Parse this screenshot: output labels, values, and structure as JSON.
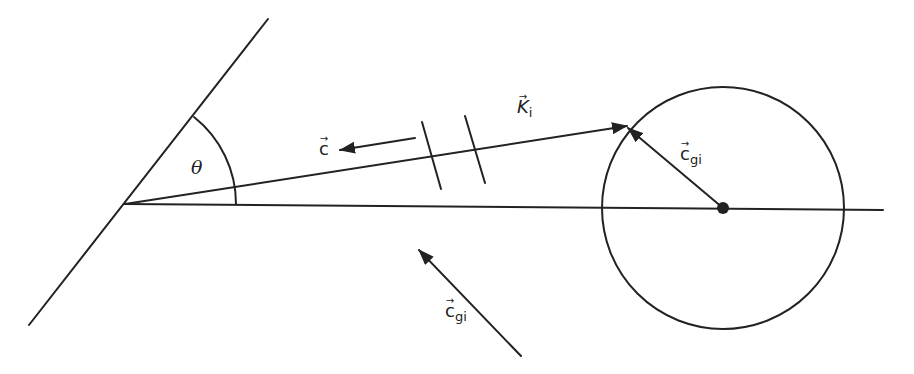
{
  "diagram": {
    "type": "geometric vector diagram",
    "colors": {
      "stroke": "#222222",
      "background": "#ffffff"
    },
    "labels": {
      "theta": "θ",
      "K_i": {
        "base": "K",
        "sub": "i",
        "arrow": "→"
      },
      "c": {
        "base": "c",
        "arrow": "→"
      },
      "c_gi_circle": {
        "base": "c",
        "sub": "gi",
        "arrow": "→"
      },
      "c_gi_lower": {
        "base": "c",
        "sub": "gi",
        "arrow": "→"
      }
    },
    "elements": {
      "wall_line": {
        "x1": 268,
        "y1": 19,
        "x2": 29,
        "y2": 325
      },
      "vertex": {
        "x": 125,
        "y": 204
      },
      "baseline": {
        "x1": 125,
        "y1": 204,
        "x2": 883,
        "y2": 210
      },
      "k_vector": {
        "x1": 125,
        "y1": 204,
        "x2": 627,
        "y2": 126
      },
      "angle_arc": {
        "cx": 125,
        "cy": 204,
        "r": 111
      },
      "circle": {
        "cx": 723,
        "cy": 208,
        "r": 121
      },
      "center_dot": {
        "cx": 723,
        "cy": 208,
        "r": 6
      },
      "c_gi_inner_vector": {
        "x1": 723,
        "y1": 208,
        "x2": 628,
        "y2": 128
      },
      "c_vector": {
        "x1": 415,
        "y1": 138,
        "x2": 340,
        "y2": 150
      },
      "c_gi_lower_vector": {
        "x1": 521,
        "y1": 356,
        "x2": 419,
        "y2": 250
      },
      "break_ticks": [
        {
          "x1": 422,
          "y1": 122,
          "x2": 441,
          "y2": 189
        },
        {
          "x1": 465,
          "y1": 116,
          "x2": 485,
          "y2": 183
        }
      ]
    }
  }
}
